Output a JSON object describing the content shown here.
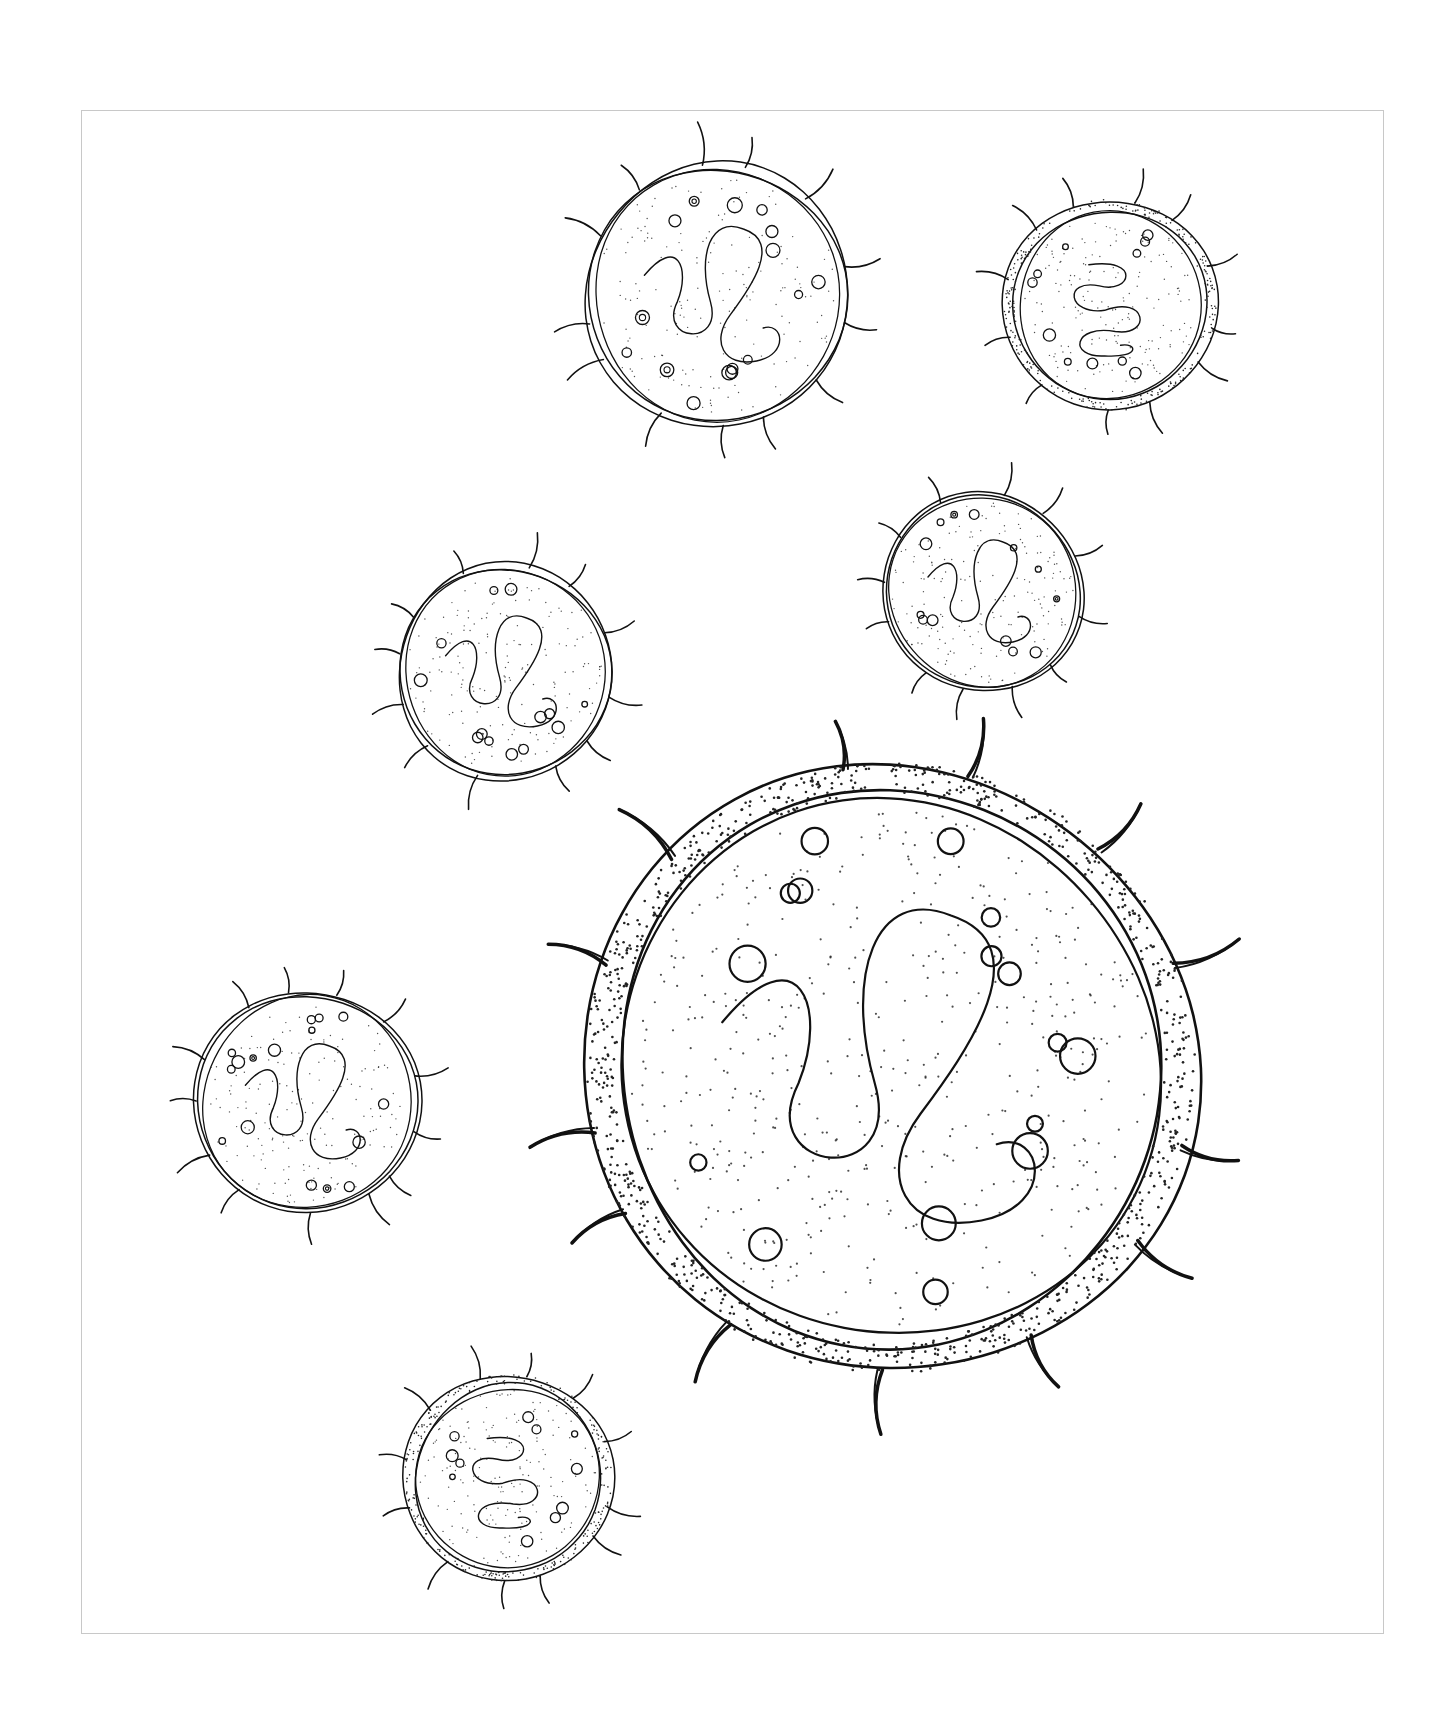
{
  "page": {
    "background": "#ffffff",
    "frame_color": "#c8c8c8",
    "ink_color": "#111111"
  },
  "illustration": {
    "subject": "cell-illustration",
    "cells": [
      {
        "id": "cell-top-center",
        "cx": 717,
        "cy": 295,
        "r": 132,
        "membrane": "double-line",
        "spikes": 13,
        "nucleus": "lobed",
        "vesicles": 16
      },
      {
        "id": "cell-top-right",
        "cx": 1110,
        "cy": 305,
        "r": 106,
        "membrane": "stippled-band",
        "spikes": 12,
        "nucleus": "serpentine",
        "vesicles": 11
      },
      {
        "id": "cell-mid-left",
        "cx": 505,
        "cy": 672,
        "r": 108,
        "membrane": "double-line",
        "spikes": 12,
        "nucleus": "lobed",
        "vesicles": 13
      },
      {
        "id": "cell-mid-right",
        "cx": 983,
        "cy": 592,
        "r": 100,
        "membrane": "double-line",
        "spikes": 12,
        "nucleus": "lobed",
        "vesicles": 13
      },
      {
        "id": "cell-large",
        "cx": 890,
        "cy": 1068,
        "r": 305,
        "membrane": "stippled-band",
        "spikes": 13,
        "nucleus": "lobed",
        "vesicles": 16
      },
      {
        "id": "cell-lower-left",
        "cx": 307,
        "cy": 1102,
        "r": 112,
        "membrane": "double-line",
        "spikes": 13,
        "nucleus": "lobed",
        "vesicles": 16
      },
      {
        "id": "cell-bottom",
        "cx": 508,
        "cy": 1478,
        "r": 104,
        "membrane": "stippled-band",
        "spikes": 12,
        "nucleus": "serpentine",
        "vesicles": 11
      }
    ]
  }
}
